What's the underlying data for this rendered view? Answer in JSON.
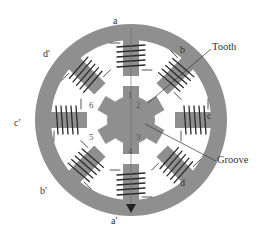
{
  "figure": {
    "colors": {
      "stator": "#8f8f8f",
      "rotor": "#8f8f8f",
      "coil": "#2a2a2a",
      "background": "#ffffff",
      "text": "#333333"
    },
    "stator": {
      "pole_count": 8,
      "pole_labels": [
        "a",
        "b",
        "c",
        "d",
        "a′",
        "b′",
        "c′",
        "d′"
      ]
    },
    "rotor": {
      "tooth_count": 6,
      "tooth_numbers": [
        "1",
        "2",
        "3",
        "4",
        "5",
        "6"
      ]
    },
    "callouts": {
      "tooth": "Tooth",
      "groove": "Groove"
    }
  }
}
